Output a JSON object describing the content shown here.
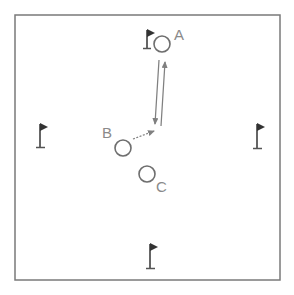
{
  "diagram": {
    "type": "drill-field",
    "colors": {
      "border": "#7a7a7a",
      "player": "#6e6e6e",
      "arrow": "#808080",
      "flag": "#333333",
      "label": "#8a8a8a"
    },
    "players": [
      {
        "id": "A",
        "label": "A",
        "x": 161,
        "y": 44
      },
      {
        "id": "B",
        "label": "B",
        "x": 123,
        "y": 148
      },
      {
        "id": "C",
        "label": "C",
        "x": 147,
        "y": 174
      }
    ],
    "flags": [
      {
        "name": "top",
        "x": 147,
        "y": 44
      },
      {
        "name": "left",
        "x": 40,
        "y": 135
      },
      {
        "name": "right",
        "x": 257,
        "y": 135
      },
      {
        "name": "bottom",
        "x": 150,
        "y": 257
      }
    ],
    "arrows": [
      {
        "from": "A",
        "to": "point",
        "style": "solid",
        "description": "pass from A down"
      },
      {
        "from": "point",
        "to": "A",
        "style": "solid",
        "description": "run back to A"
      },
      {
        "from": "B",
        "to": "point",
        "style": "dashed",
        "description": "dribble from B"
      }
    ]
  }
}
